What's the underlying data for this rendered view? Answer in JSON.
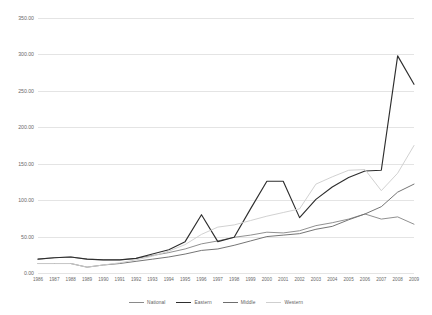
{
  "chart_data": {
    "type": "line",
    "title": "",
    "subtitle": "",
    "xlabel": "",
    "ylabel": "",
    "ylim": [
      0,
      350
    ],
    "yticks": [
      "0.00",
      "50.00",
      "100.00",
      "150.00",
      "200.00",
      "250.00",
      "300.00",
      "350.00"
    ],
    "ytick_values": [
      0,
      50,
      100,
      150,
      200,
      250,
      300,
      350
    ],
    "grid": true,
    "legend_position": "bottom",
    "categories": [
      "1986",
      "1987",
      "1988",
      "1989",
      "1990",
      "1991",
      "1992",
      "1993",
      "1994",
      "1995",
      "1996",
      "1997",
      "1998",
      "1999",
      "2000",
      "2001",
      "2002",
      "2003",
      "2004",
      "2005",
      "2006",
      "2007",
      "2008",
      "2009"
    ],
    "series": [
      {
        "name": "National",
        "color": "#8a8a8a",
        "values": [
          19,
          21,
          22,
          19,
          18,
          18,
          20,
          24,
          28,
          33,
          40,
          44,
          49,
          52,
          56,
          55,
          58,
          65,
          69,
          74,
          81,
          74,
          77,
          67
        ]
      },
      {
        "name": "Eastern",
        "color": "#2e2e2e",
        "values": [
          19,
          21,
          22,
          19,
          18,
          18,
          20,
          26,
          32,
          43,
          80,
          43,
          49,
          88,
          126,
          126,
          76,
          101,
          118,
          131,
          140,
          141,
          298,
          259
        ]
      },
      {
        "name": "Middle",
        "color": "#6e6e6e",
        "values": [
          13,
          13,
          13,
          8,
          11,
          13,
          16,
          19,
          22,
          26,
          31,
          33,
          38,
          44,
          50,
          52,
          54,
          60,
          64,
          73,
          81,
          91,
          111,
          122
        ]
      },
      {
        "name": "Western",
        "color": "#cfcfcf",
        "values": [
          13,
          13,
          13,
          8,
          11,
          14,
          18,
          23,
          30,
          39,
          53,
          63,
          66,
          72,
          78,
          83,
          88,
          122,
          132,
          141,
          142,
          113,
          137,
          175
        ]
      }
    ]
  },
  "legend": {
    "entries": [
      {
        "label": "National"
      },
      {
        "label": "Eastern"
      },
      {
        "label": "Middle"
      },
      {
        "label": "Western"
      }
    ]
  }
}
